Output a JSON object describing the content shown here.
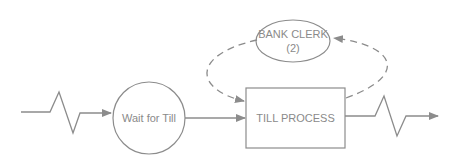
{
  "diagram": {
    "type": "activity-cycle",
    "colors": {
      "stroke": "#8c8c8c",
      "text": "#8a8a8a",
      "background": "#ffffff"
    },
    "nodes": [
      {
        "id": "wait",
        "shape": "circle",
        "label": "Wait for Till"
      },
      {
        "id": "till",
        "shape": "rectangle",
        "label": "TILL PROCESS"
      },
      {
        "id": "clerk",
        "shape": "ellipse",
        "label_line1": "BANK CLERK",
        "label_line2": "(2)"
      }
    ],
    "edges": [
      {
        "from": "arrival",
        "to": "wait",
        "style": "solid-zigzag"
      },
      {
        "from": "wait",
        "to": "till",
        "style": "solid"
      },
      {
        "from": "clerk",
        "to": "till",
        "style": "dashed"
      },
      {
        "from": "till",
        "to": "clerk",
        "style": "dashed"
      },
      {
        "from": "till",
        "to": "exit",
        "style": "solid-zigzag"
      }
    ]
  }
}
